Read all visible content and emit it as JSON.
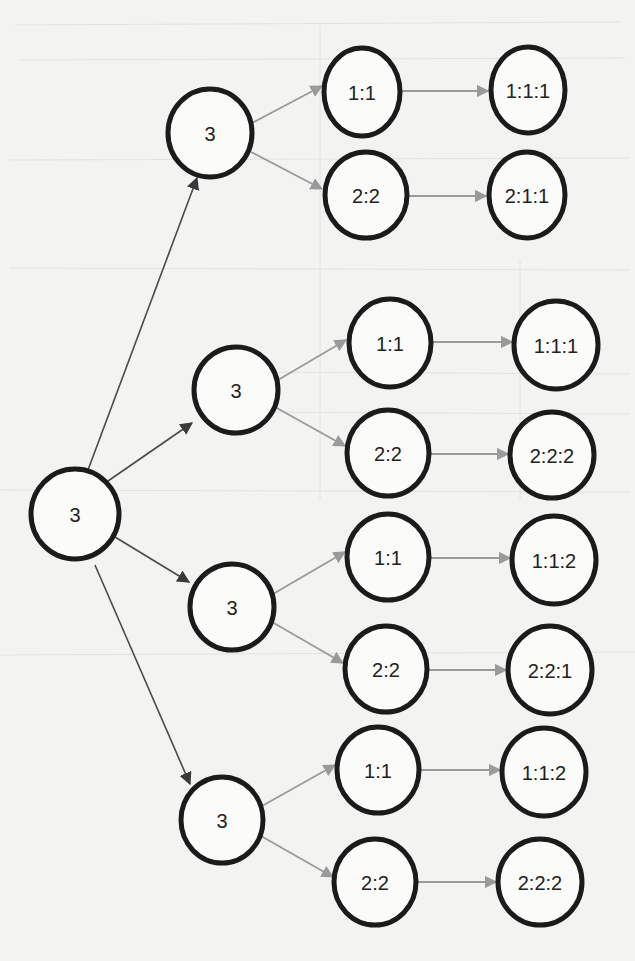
{
  "diagram": {
    "type": "tree",
    "colors": {
      "background": "#f3f3f1",
      "node_stroke": "#1b1b1b",
      "node_fill": "#fbfbfa",
      "edge_root": "#4a4a4a",
      "edge_branch": "#9a9a9a",
      "text": "#222222"
    },
    "nodes": [
      {
        "id": "root",
        "label": "3",
        "cx": 75,
        "cy": 514,
        "rx": 44,
        "ry": 45,
        "level": 0
      },
      {
        "id": "a",
        "label": "3",
        "cx": 210,
        "cy": 133,
        "rx": 42,
        "ry": 44,
        "level": 1
      },
      {
        "id": "b",
        "label": "3",
        "cx": 236,
        "cy": 390,
        "rx": 42,
        "ry": 43,
        "level": 1
      },
      {
        "id": "c",
        "label": "3",
        "cx": 232,
        "cy": 607,
        "rx": 42,
        "ry": 43,
        "level": 1
      },
      {
        "id": "d",
        "label": "3",
        "cx": 222,
        "cy": 820,
        "rx": 41,
        "ry": 43,
        "level": 1
      },
      {
        "id": "a1",
        "label": "1:1",
        "cx": 362,
        "cy": 92,
        "rx": 38,
        "ry": 44,
        "level": 2
      },
      {
        "id": "a2",
        "label": "2:2",
        "cx": 366,
        "cy": 195,
        "rx": 41,
        "ry": 43,
        "level": 2
      },
      {
        "id": "b1",
        "label": "1:1",
        "cx": 390,
        "cy": 343,
        "rx": 41,
        "ry": 44,
        "level": 2
      },
      {
        "id": "b2",
        "label": "2:2",
        "cx": 388,
        "cy": 453,
        "rx": 41,
        "ry": 43,
        "level": 2
      },
      {
        "id": "c1",
        "label": "1:1",
        "cx": 388,
        "cy": 557,
        "rx": 41,
        "ry": 43,
        "level": 2
      },
      {
        "id": "c2",
        "label": "2:2",
        "cx": 386,
        "cy": 669,
        "rx": 41,
        "ry": 43,
        "level": 2
      },
      {
        "id": "d1",
        "label": "1:1",
        "cx": 378,
        "cy": 770,
        "rx": 41,
        "ry": 43,
        "level": 2
      },
      {
        "id": "d2",
        "label": "2:2",
        "cx": 375,
        "cy": 882,
        "rx": 41,
        "ry": 43,
        "level": 2
      },
      {
        "id": "a1x",
        "label": "1:1:1",
        "cx": 528,
        "cy": 90,
        "rx": 37,
        "ry": 43,
        "level": 3
      },
      {
        "id": "a2x",
        "label": "2:1:1",
        "cx": 527,
        "cy": 195,
        "rx": 38,
        "ry": 43,
        "level": 3
      },
      {
        "id": "b1x",
        "label": "1:1:1",
        "cx": 556,
        "cy": 345,
        "rx": 42,
        "ry": 44,
        "level": 3
      },
      {
        "id": "b2x",
        "label": "2:2:2",
        "cx": 552,
        "cy": 455,
        "rx": 42,
        "ry": 43,
        "level": 3
      },
      {
        "id": "c1x",
        "label": "1:1:2",
        "cx": 554,
        "cy": 560,
        "rx": 42,
        "ry": 44,
        "level": 3
      },
      {
        "id": "c2x",
        "label": "2:2:1",
        "cx": 550,
        "cy": 670,
        "rx": 42,
        "ry": 44,
        "level": 3
      },
      {
        "id": "d1x",
        "label": "1:1:2",
        "cx": 544,
        "cy": 772,
        "rx": 42,
        "ry": 44,
        "level": 3
      },
      {
        "id": "d2x",
        "label": "2:2:2",
        "cx": 540,
        "cy": 882,
        "rx": 42,
        "ry": 43,
        "level": 3
      }
    ],
    "edges": [
      {
        "from": "root",
        "to": "a",
        "style": "dark",
        "x1": 88,
        "y1": 470,
        "x2": 197,
        "y2": 178
      },
      {
        "from": "root",
        "to": "b",
        "style": "dark",
        "x1": 108,
        "y1": 481,
        "x2": 192,
        "y2": 423
      },
      {
        "from": "root",
        "to": "c",
        "style": "dark",
        "x1": 115,
        "y1": 537,
        "x2": 189,
        "y2": 582
      },
      {
        "from": "root",
        "to": "d",
        "style": "dark",
        "x1": 95,
        "y1": 565,
        "x2": 190,
        "y2": 784
      },
      {
        "from": "a",
        "to": "a1",
        "style": "gray",
        "x1": 252,
        "y1": 123,
        "x2": 322,
        "y2": 86
      },
      {
        "from": "a",
        "to": "a2",
        "style": "gray",
        "x1": 251,
        "y1": 152,
        "x2": 322,
        "y2": 189
      },
      {
        "from": "b",
        "to": "b1",
        "style": "gray",
        "x1": 278,
        "y1": 380,
        "x2": 346,
        "y2": 340
      },
      {
        "from": "b",
        "to": "b2",
        "style": "gray",
        "x1": 275,
        "y1": 407,
        "x2": 345,
        "y2": 446
      },
      {
        "from": "c",
        "to": "c1",
        "style": "gray",
        "x1": 273,
        "y1": 594,
        "x2": 345,
        "y2": 552
      },
      {
        "from": "c",
        "to": "c2",
        "style": "gray",
        "x1": 272,
        "y1": 622,
        "x2": 343,
        "y2": 663
      },
      {
        "from": "d",
        "to": "d1",
        "style": "gray",
        "x1": 262,
        "y1": 806,
        "x2": 335,
        "y2": 765
      },
      {
        "from": "d",
        "to": "d2",
        "style": "gray",
        "x1": 261,
        "y1": 836,
        "x2": 333,
        "y2": 877
      },
      {
        "from": "a1",
        "to": "a1x",
        "style": "gray",
        "x1": 402,
        "y1": 91,
        "x2": 488,
        "y2": 91
      },
      {
        "from": "a2",
        "to": "a2x",
        "style": "gray",
        "x1": 407,
        "y1": 196,
        "x2": 486,
        "y2": 196
      },
      {
        "from": "b1",
        "to": "b1x",
        "style": "gray",
        "x1": 433,
        "y1": 342,
        "x2": 512,
        "y2": 342
      },
      {
        "from": "b2",
        "to": "b2x",
        "style": "gray",
        "x1": 429,
        "y1": 454,
        "x2": 508,
        "y2": 454
      },
      {
        "from": "c1",
        "to": "c1x",
        "style": "gray",
        "x1": 431,
        "y1": 558,
        "x2": 510,
        "y2": 558
      },
      {
        "from": "c2",
        "to": "c2x",
        "style": "gray",
        "x1": 427,
        "y1": 670,
        "x2": 506,
        "y2": 670
      },
      {
        "from": "d1",
        "to": "d1x",
        "style": "gray",
        "x1": 420,
        "y1": 770,
        "x2": 500,
        "y2": 770
      },
      {
        "from": "d2",
        "to": "d2x",
        "style": "gray",
        "x1": 417,
        "y1": 882,
        "x2": 496,
        "y2": 882
      }
    ]
  }
}
